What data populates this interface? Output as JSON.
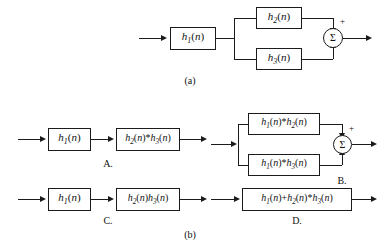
{
  "figure": {
    "caption_a": "(a)",
    "caption_b": "(b)"
  },
  "diagram_a": {
    "name": "cascade-parallel-system",
    "first_block": "h₁(n)",
    "upper_block": "h₂(n)",
    "lower_block": "h₃(n)",
    "summer_symbol": "Σ",
    "upper_sign": "+",
    "lower_sign": "",
    "input_label": "",
    "output_label": ""
  },
  "options": [
    {
      "id": "A",
      "label": "A.",
      "type": "cascade",
      "blocks": [
        "h₁(n)",
        "h₂(n)*h₃(n)"
      ]
    },
    {
      "id": "B",
      "label": "B.",
      "type": "parallel-sum",
      "upper_block": "h₁(n)*h₂(n)",
      "lower_block": "h₁(n)*h₃(n)",
      "summer_symbol": "Σ",
      "upper_sign": "+"
    },
    {
      "id": "C",
      "label": "C.",
      "type": "cascade",
      "blocks": [
        "h₁(n)",
        "h₂(n)h₃(n)"
      ]
    },
    {
      "id": "D",
      "label": "D.",
      "type": "single",
      "blocks": [
        "h₁(n)+h₂(n)*h₃(n)"
      ]
    }
  ]
}
